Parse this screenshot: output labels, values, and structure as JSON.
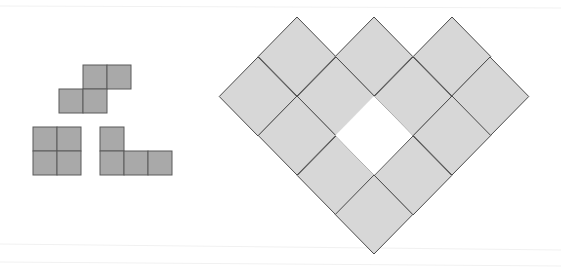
{
  "diagram": {
    "width": 561,
    "height": 278,
    "background": "#ffffff",
    "colors": {
      "piece_fill": "#a9a9a9",
      "piece_stroke": "#5a5a5a",
      "tile_fill": "#d7d7d7",
      "tile_stroke": "#4a4a4a"
    },
    "pieces": [
      {
        "name": "s-tetromino",
        "cell_size": 24,
        "cells": [
          [
            83,
            65
          ],
          [
            107,
            65
          ],
          [
            59,
            89
          ],
          [
            83,
            89
          ]
        ]
      },
      {
        "name": "o-tetromino",
        "cell_size": 24,
        "cells": [
          [
            33,
            127
          ],
          [
            57,
            127
          ],
          [
            33,
            151
          ],
          [
            57,
            151
          ]
        ]
      },
      {
        "name": "l-tetromino",
        "cell_size": 24,
        "cells": [
          [
            100,
            127
          ],
          [
            100,
            151
          ],
          [
            124,
            151
          ],
          [
            148,
            151
          ]
        ]
      }
    ],
    "heart": {
      "name": "heart-region",
      "half_width": 38.75,
      "half_height": 39.5,
      "tile_tops": [
        [
          297,
          17
        ],
        [
          374,
          17
        ],
        [
          452,
          17
        ],
        [
          258,
          57
        ],
        [
          336,
          57
        ],
        [
          413,
          57
        ],
        [
          490,
          57
        ],
        [
          297,
          96
        ],
        [
          452,
          96
        ],
        [
          336,
          136
        ],
        [
          413,
          136
        ],
        [
          374,
          175
        ]
      ],
      "hole_top": [
        374,
        96
      ]
    }
  }
}
